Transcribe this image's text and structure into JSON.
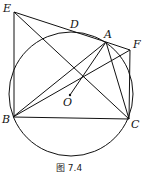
{
  "caption": "图 7.4",
  "points": {
    "E": "E",
    "D": "D",
    "A": "A",
    "F": "F",
    "O": "O",
    "B": "B",
    "C": "C"
  },
  "segments": [
    "EB",
    "ED",
    "DA",
    "AF",
    "FC",
    "EC",
    "BA",
    "BF",
    "BC",
    "AC",
    "AO",
    "AD"
  ]
}
